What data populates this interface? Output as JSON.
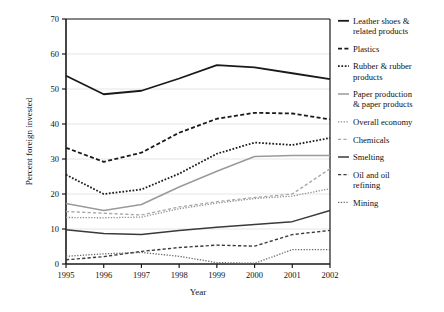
{
  "chart_data": {
    "type": "line",
    "title": "",
    "xlabel": "Year",
    "ylabel": "Percent foreign invested",
    "x": [
      1995,
      1996,
      1997,
      1998,
      1999,
      2000,
      2001,
      2002
    ],
    "categories": [
      "1995",
      "1996",
      "1997",
      "1998",
      "1999",
      "2000",
      "2001",
      "2002"
    ],
    "xlim": [
      1995,
      2002
    ],
    "ylim": [
      0,
      70
    ],
    "yticks": [
      0,
      10,
      20,
      30,
      40,
      50,
      60,
      70
    ],
    "ytick_labels": [
      "0",
      "10",
      "20",
      "30",
      "40",
      "50",
      "60",
      "70"
    ],
    "grid": "horizontal",
    "legend_position": "right",
    "series": [
      {
        "name": "Leather shoes & related products",
        "style": "solid",
        "color": "#1a1a1a",
        "width": 1.8,
        "values": [
          53.8,
          48.5,
          49.5,
          53.0,
          56.8,
          56.2,
          54.5,
          52.8
        ]
      },
      {
        "name": "Plastics",
        "style": "dashed",
        "color": "#1a1a1a",
        "width": 1.8,
        "values": [
          33.2,
          29.2,
          31.8,
          37.5,
          41.5,
          43.2,
          43.0,
          41.3
        ]
      },
      {
        "name": "Rubber & rubber products",
        "style": "dotted",
        "color": "#1a1a1a",
        "width": 1.8,
        "values": [
          25.5,
          20.0,
          21.3,
          25.8,
          31.5,
          34.7,
          34.0,
          36.0
        ]
      },
      {
        "name": "Paper production & paper products",
        "style": "solid",
        "color": "#9a9a9a",
        "width": 1.5,
        "values": [
          17.3,
          15.3,
          17.0,
          22.0,
          26.5,
          30.7,
          31.0,
          31.0
        ]
      },
      {
        "name": "Overall economy",
        "style": "dotted",
        "color": "#8f8f8f",
        "width": 1.3,
        "values": [
          13.3,
          13.2,
          13.4,
          15.8,
          17.4,
          18.7,
          19.4,
          21.5
        ]
      },
      {
        "name": "Chemicals",
        "style": "dashed",
        "color": "#a8a8a8",
        "width": 1.3,
        "values": [
          15.0,
          14.5,
          14.0,
          16.3,
          17.8,
          19.0,
          20.0,
          27.2
        ]
      },
      {
        "name": "Smelting",
        "style": "solid",
        "color": "#3a3a3a",
        "width": 1.5,
        "values": [
          9.8,
          8.7,
          8.4,
          9.6,
          10.5,
          11.3,
          12.1,
          15.3
        ]
      },
      {
        "name": "Oil and oil refining",
        "style": "dashed",
        "color": "#3a3a3a",
        "width": 1.4,
        "values": [
          1.2,
          2.1,
          3.6,
          4.7,
          5.4,
          5.1,
          8.4,
          9.6
        ]
      },
      {
        "name": "Mining",
        "style": "dotted",
        "color": "#6a6a6a",
        "width": 1.3,
        "values": [
          2.2,
          2.9,
          3.3,
          2.2,
          0.4,
          0.2,
          4.1,
          4.1
        ]
      }
    ]
  },
  "legend": {
    "items": [
      {
        "label_line1": "Leather shoes &",
        "label_line2": "related products"
      },
      {
        "label_line1": "Plastics",
        "label_line2": ""
      },
      {
        "label_line1": "Rubber & rubber",
        "label_line2": "products"
      },
      {
        "label_line1": "Paper production",
        "label_line2": "& paper products"
      },
      {
        "label_line1": "Overall economy",
        "label_line2": ""
      },
      {
        "label_line1": "Chemicals",
        "label_line2": ""
      },
      {
        "label_line1": "Smelting",
        "label_line2": ""
      },
      {
        "label_line1": "Oil and oil",
        "label_line2": "refining"
      },
      {
        "label_line1": "Mining",
        "label_line2": ""
      }
    ]
  }
}
